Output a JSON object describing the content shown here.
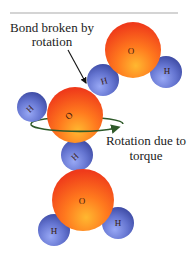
{
  "diagram": {
    "top_rule_color": "#a9a9a9",
    "labels": {
      "bond_broken_line1": "Bond broken by",
      "bond_broken_line2": "rotation",
      "rotation_line1": "Rotation due to",
      "rotation_line2": "torque"
    },
    "atoms": {
      "oxygen_symbol": "O",
      "hydrogen_symbol": "H"
    },
    "colors": {
      "oxygen_light": "#ffa321",
      "oxygen_dark": "#f0391c",
      "hydrogen_light": "#8d9bf0",
      "hydrogen_dark": "#3b4aa8",
      "rotation_ring": "#2f5a2a",
      "arrow": "#111111"
    },
    "molecules": [
      {
        "name": "water-molecule-top-right",
        "O": "O",
        "H1": "H",
        "H2": "H"
      },
      {
        "name": "water-molecule-middle",
        "O": "O",
        "H1": "H",
        "H2": "H"
      },
      {
        "name": "water-molecule-bottom",
        "O": "O",
        "H1": "H",
        "H2": "H"
      }
    ]
  }
}
